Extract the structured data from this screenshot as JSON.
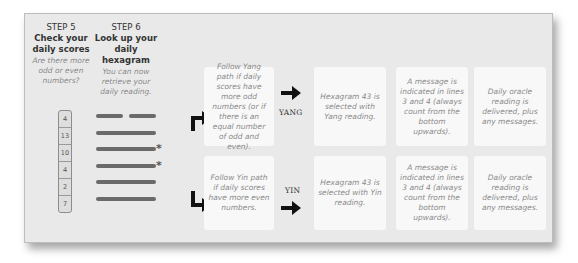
{
  "steps": [
    {
      "label": "STEP 5",
      "title_line1": "Check your",
      "title_line2": "daily scores",
      "sub_line1": "Are there more",
      "sub_line2": "odd or even",
      "sub_line3": "numbers?"
    },
    {
      "label": "STEP 6",
      "title_line1": "Look up your",
      "title_line2": "daily hexagram",
      "sub_line1": "You can now",
      "sub_line2": "retrieve your",
      "sub_line3": "daily reading."
    }
  ],
  "scores": [
    "4",
    "13",
    "10",
    "4",
    "2",
    "7"
  ],
  "hexagram": {
    "lines": [
      {
        "type": "broken",
        "marked": false
      },
      {
        "type": "solid",
        "marked": false
      },
      {
        "type": "solid",
        "marked": true
      },
      {
        "type": "solid",
        "marked": true
      },
      {
        "type": "solid",
        "marked": false
      },
      {
        "type": "solid",
        "marked": false
      }
    ],
    "marker": "*"
  },
  "paths": {
    "yang": {
      "label": "YANG",
      "condition": "Follow Yang path if daily scores have more odd numbers (or if there is an equal number of odd and even).",
      "hexagram": "Hexagram 43 is selected with Yang reading.",
      "message": "A message is indicated in lines 3 and 4 (always count from the bottom upwards).",
      "result": "Daily oracle reading is delivered, plus any messages."
    },
    "yin": {
      "label": "YIN",
      "condition": "Follow Yin path if daily scores have more even numbers.",
      "hexagram": "Hexagram 43 is selected with Yin reading.",
      "message": "A message is indicated in lines 3 and 4 (always count from the bottom upwards).",
      "result": "Daily oracle reading is delivered, plus any messages."
    }
  },
  "colors": {
    "panel_bg": "#e9e9e9",
    "box_bg": "#f8f8f8",
    "line": "#6a6a6a",
    "arrow": "#111111",
    "italic_text": "#8a8a8a"
  }
}
